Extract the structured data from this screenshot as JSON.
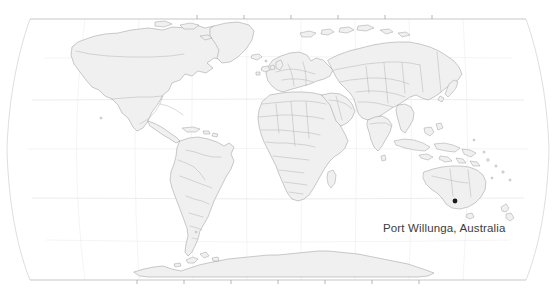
{
  "map": {
    "projection": "robinson",
    "background_color": "#ffffff",
    "land_fill": "#f0f0f0",
    "land_stroke": "#8c8c8c",
    "graticule_color": "#d9d9d9",
    "frame_color": "#b0b0b0",
    "marker_color": "#1a1a1a",
    "label_color": "#3c3c3c"
  },
  "label": {
    "text": "Port Willunga, Australia",
    "x": 383,
    "y": 221
  },
  "marker": {
    "name": "Port Willunga",
    "x": 455,
    "y": 201,
    "radius": 2.4
  },
  "graticule": {
    "meridian_spacing_deg": 30,
    "parallel_spacing_deg": 30,
    "top_ticks": [
      197,
      244,
      291,
      338,
      385,
      432
    ],
    "bottom_ticks": [
      137,
      184,
      231,
      278,
      325,
      372
    ]
  }
}
